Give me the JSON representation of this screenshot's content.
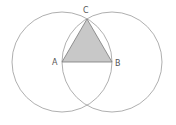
{
  "diagram": {
    "colors": {
      "circle_stroke": "#9a9a9a",
      "triangle_fill": "#c8c8c8",
      "triangle_stroke": "#7a7a7a",
      "label": "#555555"
    },
    "points": {
      "A": {
        "label": "A",
        "x": 62,
        "y": 62
      },
      "B": {
        "label": "B",
        "x": 112,
        "y": 62
      },
      "C": {
        "label": "C",
        "x": 87,
        "y": 19
      }
    },
    "circles": [
      {
        "center": "A",
        "radius": 50
      },
      {
        "center": "B",
        "radius": 50
      }
    ],
    "triangle": [
      "A",
      "B",
      "C"
    ]
  }
}
